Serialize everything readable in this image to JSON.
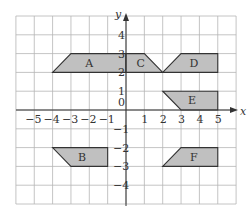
{
  "diagram": {
    "type": "coordinate-grid",
    "x_range": [
      -6,
      6
    ],
    "y_range": [
      -5,
      5
    ],
    "axes": {
      "x_label": "x",
      "y_label": "y",
      "origin_label": "0"
    },
    "x_ticks": [
      {
        "value": -5,
        "label": "−5"
      },
      {
        "value": -4,
        "label": "−4"
      },
      {
        "value": -3,
        "label": "−3"
      },
      {
        "value": -2,
        "label": "−2"
      },
      {
        "value": -1,
        "label": "−1"
      },
      {
        "value": 1,
        "label": "1"
      },
      {
        "value": 2,
        "label": "2"
      },
      {
        "value": 3,
        "label": "3"
      },
      {
        "value": 4,
        "label": "4"
      },
      {
        "value": 5,
        "label": "5"
      }
    ],
    "y_ticks": [
      {
        "value": 4,
        "label": "4"
      },
      {
        "value": 3,
        "label": "3"
      },
      {
        "value": 2,
        "label": "2"
      },
      {
        "value": 1,
        "label": "1"
      },
      {
        "value": -1,
        "label": "−1"
      },
      {
        "value": -2,
        "label": "−2"
      },
      {
        "value": -3,
        "label": "−3"
      },
      {
        "value": -4,
        "label": "−4"
      }
    ],
    "shapes": [
      {
        "label": "A",
        "points": [
          [
            -4,
            2
          ],
          [
            -3,
            3
          ],
          [
            0,
            3
          ],
          [
            0,
            2
          ]
        ],
        "label_at": [
          -2,
          2.5
        ]
      },
      {
        "label": "C",
        "points": [
          [
            0,
            2
          ],
          [
            0,
            3
          ],
          [
            1,
            3
          ],
          [
            2,
            2
          ]
        ],
        "label_at": [
          0.8,
          2.5
        ]
      },
      {
        "label": "D",
        "points": [
          [
            2,
            2
          ],
          [
            3,
            3
          ],
          [
            5,
            3
          ],
          [
            5,
            2
          ]
        ],
        "label_at": [
          3.7,
          2.5
        ]
      },
      {
        "label": "E",
        "points": [
          [
            2,
            1
          ],
          [
            5,
            1
          ],
          [
            5,
            0
          ],
          [
            3,
            0
          ]
        ],
        "label_at": [
          3.6,
          0.5
        ]
      },
      {
        "label": "B",
        "points": [
          [
            -4,
            -2
          ],
          [
            -1,
            -2
          ],
          [
            -1,
            -3
          ],
          [
            -3,
            -3
          ]
        ],
        "label_at": [
          -2.4,
          -2.5
        ]
      },
      {
        "label": "F",
        "points": [
          [
            2,
            -3
          ],
          [
            3,
            -2
          ],
          [
            5,
            -2
          ],
          [
            5,
            -3
          ]
        ],
        "label_at": [
          3.7,
          -2.5
        ]
      }
    ],
    "colors": {
      "shape_fill": "#c0c0c0",
      "stroke": "#333333",
      "grid": "#b5b5b5"
    }
  }
}
